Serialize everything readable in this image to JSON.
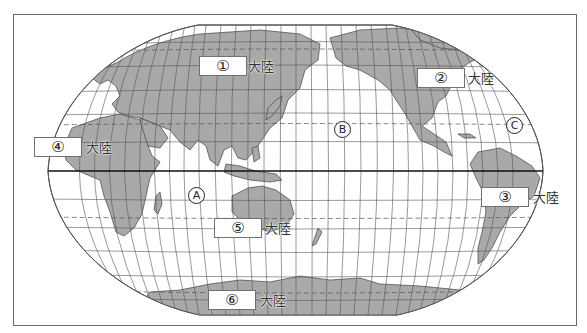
{
  "figure": {
    "type": "world-map",
    "projection": "pacific-centered oval",
    "equator_drawn": true,
    "colors": {
      "land": "#a9a9a9",
      "ocean": "#ffffff",
      "grid": "#555555",
      "equator": "#111111",
      "frame": "#6a6a6a"
    }
  },
  "continents": [
    {
      "id": "1",
      "number": "①",
      "suffix": "大陸"
    },
    {
      "id": "2",
      "number": "②",
      "suffix": "大陸"
    },
    {
      "id": "3",
      "number": "③",
      "suffix": "大陸"
    },
    {
      "id": "4",
      "number": "④",
      "suffix": "大陸"
    },
    {
      "id": "5",
      "number": "⑤",
      "suffix": "大陸"
    },
    {
      "id": "6",
      "number": "⑥",
      "suffix": "大陸"
    }
  ],
  "oceans": [
    {
      "id": "A",
      "letter": "A"
    },
    {
      "id": "B",
      "letter": "B"
    },
    {
      "id": "C",
      "letter": "C"
    }
  ]
}
